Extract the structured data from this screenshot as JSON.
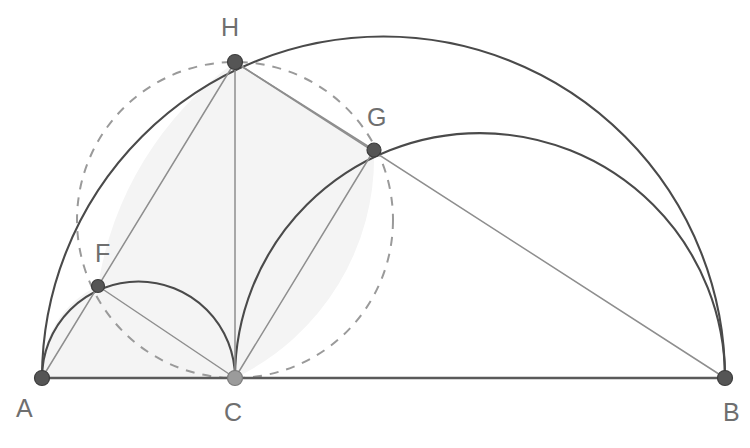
{
  "figure": {
    "width": 750,
    "height": 448,
    "background_color": "#ffffff"
  },
  "colors": {
    "arc_dark": "#4a4a4a",
    "line_thin": "#8e8e8e",
    "baseline": "#5a5a5a",
    "dashed_circle": "#9a9a9a",
    "shaded_region": "#f4f4f4",
    "vertex_dark": "#555555",
    "vertex_light": "#9b9b9b",
    "label_text": "#6f6f6f"
  },
  "points": [
    {
      "id": "A",
      "label": "A",
      "x": 42,
      "y": 378,
      "label_x": 16,
      "label_y": 417,
      "marker": "dark",
      "radius": 7.5
    },
    {
      "id": "C",
      "label": "C",
      "x": 235,
      "y": 378,
      "label_x": 224,
      "label_y": 421,
      "marker": "light",
      "radius": 7.5
    },
    {
      "id": "B",
      "label": "B",
      "x": 725,
      "y": 378,
      "label_x": 723,
      "label_y": 421,
      "marker": "dark",
      "radius": 7.5
    },
    {
      "id": "F",
      "label": "F",
      "x": 98,
      "y": 286,
      "label_x": 95,
      "label_y": 262,
      "marker": "dark",
      "radius": 6.5
    },
    {
      "id": "H",
      "label": "H",
      "x": 235,
      "y": 62,
      "label_x": 221,
      "label_y": 36,
      "marker": "dark",
      "radius": 7.5
    },
    {
      "id": "G",
      "label": "G",
      "x": 374,
      "y": 150,
      "label_x": 367,
      "label_y": 126,
      "marker": "dark",
      "radius": 7.0
    }
  ],
  "arcs": [
    {
      "id": "semicircle-AB",
      "name": "large-semicircle-on-AB",
      "cx": 383.5,
      "cy": 378,
      "r": 341.5,
      "from": "A",
      "to": "B",
      "style": "dark"
    },
    {
      "id": "semicircle-AC",
      "name": "small-semicircle-on-AC",
      "cx": 138.5,
      "cy": 378,
      "r": 96.5,
      "from": "A",
      "to": "C",
      "style": "dark"
    },
    {
      "id": "semicircle-CB",
      "name": "medium-semicircle-on-CB",
      "cx": 480,
      "cy": 378,
      "r": 245,
      "from": "C",
      "to": "B",
      "style": "dark"
    }
  ],
  "dashed_circle": {
    "id": "dashed-circumcircle",
    "name": "dashed-circle-through-C-F-H-G",
    "cx": 235,
    "cy": 220,
    "r": 158,
    "passes_through": [
      "C",
      "F",
      "H",
      "G"
    ]
  },
  "segments": [
    {
      "id": "seg-AB",
      "name": "baseline-A-to-B",
      "from": "A",
      "to": "B",
      "style": "base"
    },
    {
      "id": "seg-AH",
      "name": "chord-A-to-H",
      "from": "A",
      "to": "H",
      "style": "thin"
    },
    {
      "id": "seg-CH",
      "name": "altitude-C-to-H",
      "from": "C",
      "to": "H",
      "style": "thin"
    },
    {
      "id": "seg-CF",
      "name": "chord-C-to-F",
      "from": "C",
      "to": "F",
      "style": "thin"
    },
    {
      "id": "seg-CG",
      "name": "chord-C-to-G",
      "from": "C",
      "to": "G",
      "style": "thin"
    },
    {
      "id": "seg-HG",
      "name": "chord-H-to-G",
      "from": "H",
      "to": "G",
      "style": "thin"
    },
    {
      "id": "seg-HB",
      "name": "chord-H-to-B",
      "from": "H",
      "to": "B",
      "style": "thin"
    }
  ],
  "shaded_region": {
    "name": "interior-shaded-region",
    "vertices": [
      "A",
      "F",
      "H",
      "G",
      "C"
    ]
  }
}
